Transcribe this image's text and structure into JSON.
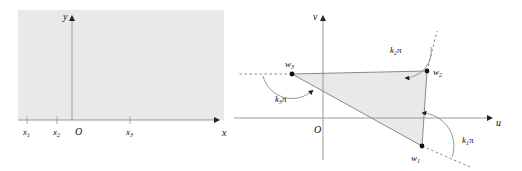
{
  "figure": {
    "type": "diagram",
    "colors": {
      "shading": "#e8e8e8",
      "line": "#8a8a8a",
      "axis": "#9a9a9a",
      "text": "#111111",
      "background": "#ffffff"
    }
  },
  "left_panel": {
    "name": "z-plane upper half plane",
    "axes": {
      "x_label": "x",
      "y_label": "y",
      "origin_label": "O"
    },
    "ticks": [
      {
        "label": "x",
        "sub": "1",
        "x": 27
      },
      {
        "label": "x",
        "sub": "2",
        "x": 57
      },
      {
        "label": "x",
        "sub": "3",
        "x": 130
      }
    ],
    "shaded_region": "upper half plane"
  },
  "right_panel": {
    "name": "w-plane polygon image",
    "axes": {
      "x_label": "u",
      "y_label": "v",
      "origin_label": "O"
    },
    "vertices": [
      {
        "label": "w",
        "sub": "1",
        "u": 422,
        "v": 146
      },
      {
        "label": "w",
        "sub": "2",
        "u": 427,
        "v": 71
      },
      {
        "label": "w",
        "sub": "3",
        "u": 292,
        "v": 74
      }
    ],
    "angles": [
      {
        "label": "k",
        "sub": "1",
        "symbol": "π"
      },
      {
        "label": "k",
        "sub": "2",
        "symbol": "π"
      },
      {
        "label": "k",
        "sub": "3",
        "symbol": "π"
      }
    ],
    "shaded_region": "polygon interior"
  }
}
